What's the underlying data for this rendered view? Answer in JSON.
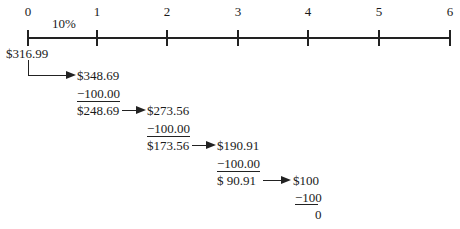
{
  "timeline": {
    "periods": [
      "0",
      "1",
      "2",
      "3",
      "4",
      "5",
      "6"
    ],
    "rate_label": "10%"
  },
  "calculation": {
    "present_value": "$316.99",
    "steps": [
      {
        "grown": "$348.69",
        "payment": "−100.00",
        "remaining": "$248.69"
      },
      {
        "grown": "$273.56",
        "payment": "−100.00",
        "remaining": "$173.56"
      },
      {
        "grown": "$190.91",
        "payment": "−100.00",
        "remaining": "$ 90.91"
      },
      {
        "grown": "$100",
        "payment": "−100",
        "remaining": "0"
      }
    ]
  }
}
